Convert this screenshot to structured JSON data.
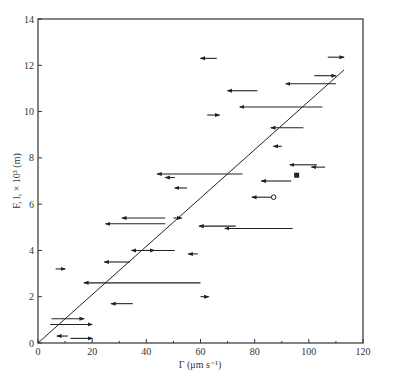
{
  "chart_data": {
    "type": "scatter",
    "title": "",
    "xlabel": "Γ (μm s⁻¹)",
    "ylabel": "F, l, × 10³ (m)",
    "xlim": [
      0,
      120
    ],
    "ylim": [
      0,
      14
    ],
    "x_ticks": [
      0,
      20,
      40,
      60,
      80,
      100,
      120
    ],
    "y_ticks": [
      0,
      2,
      4,
      6,
      8,
      10,
      12,
      14
    ],
    "x_minor_ticks": [
      10,
      30,
      50,
      70,
      90,
      110
    ],
    "grid": false,
    "legend": null,
    "fit_line": {
      "x": [
        0,
        113
      ],
      "y": [
        0,
        11.8
      ],
      "label": "linear fit through origin"
    },
    "series": [
      {
        "name": "arrows (x_start → x_end at y)",
        "marker": "arrow",
        "points": [
          {
            "x1": 107,
            "x2": 113,
            "y": 12.35
          },
          {
            "x1": 66,
            "x2": 60,
            "y": 12.3
          },
          {
            "x1": 102,
            "x2": 110,
            "y": 11.55
          },
          {
            "x1": 110,
            "x2": 91.5,
            "y": 11.2
          },
          {
            "x1": 81,
            "x2": 70,
            "y": 10.9
          },
          {
            "x1": 105,
            "x2": 74.5,
            "y": 10.2
          },
          {
            "x1": 62.5,
            "x2": 67,
            "y": 9.85
          },
          {
            "x1": 98,
            "x2": 86,
            "y": 9.3
          },
          {
            "x1": 90,
            "x2": 87,
            "y": 8.5
          },
          {
            "x1": 103,
            "x2": 93,
            "y": 7.7
          },
          {
            "x1": 106,
            "x2": 101,
            "y": 7.6
          },
          {
            "x1": 75.5,
            "x2": 44,
            "y": 7.3
          },
          {
            "x1": 50.5,
            "x2": 47,
            "y": 7.15
          },
          {
            "x1": 93.5,
            "x2": 82.5,
            "y": 7.0
          },
          {
            "x1": 55,
            "x2": 50.5,
            "y": 6.7
          },
          {
            "x1": 86,
            "x2": 79,
            "y": 6.3
          },
          {
            "x1": 47,
            "x2": 31,
            "y": 5.4
          },
          {
            "x1": 50,
            "x2": 53,
            "y": 5.4
          },
          {
            "x1": 47,
            "x2": 25,
            "y": 5.15
          },
          {
            "x1": 73,
            "x2": 59.5,
            "y": 5.05
          },
          {
            "x1": 94,
            "x2": 69,
            "y": 4.95
          },
          {
            "x1": 50.5,
            "x2": 34.5,
            "y": 4.0
          },
          {
            "x1": 39.5,
            "x2": 43,
            "y": 4.0
          },
          {
            "x1": 59,
            "x2": 55.5,
            "y": 3.85
          },
          {
            "x1": 34,
            "x2": 24.5,
            "y": 3.5
          },
          {
            "x1": 6.5,
            "x2": 10,
            "y": 3.2
          },
          {
            "x1": 60,
            "x2": 17,
            "y": 2.6
          },
          {
            "x1": 60,
            "x2": 63,
            "y": 2.0
          },
          {
            "x1": 35,
            "x2": 27,
            "y": 1.7
          },
          {
            "x1": 5,
            "x2": 17,
            "y": 1.05
          },
          {
            "x1": 4.5,
            "x2": 20,
            "y": 0.8
          },
          {
            "x1": 11,
            "x2": 7,
            "y": 0.3
          },
          {
            "x1": 12,
            "x2": 20,
            "y": 0.2
          }
        ]
      },
      {
        "name": "filled square",
        "marker": "square",
        "points": [
          {
            "x": 95.5,
            "y": 7.25
          }
        ]
      },
      {
        "name": "open circle",
        "marker": "circle-open",
        "points": [
          {
            "x": 87,
            "y": 6.3
          }
        ]
      }
    ]
  }
}
